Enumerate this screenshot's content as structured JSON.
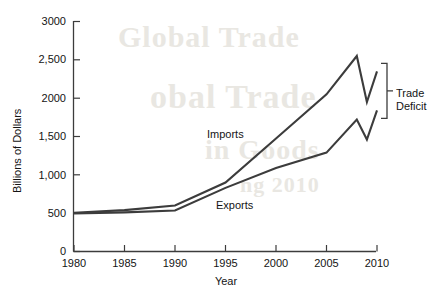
{
  "chart_data": {
    "type": "line",
    "title": "",
    "xlabel": "Year",
    "ylabel": "Billions of Dollars",
    "xlim": [
      1980,
      2010
    ],
    "ylim": [
      0,
      3000
    ],
    "grid": false,
    "legend_position": "inline-labels",
    "x_tick_labels": [
      "1980",
      "1985",
      "1990",
      "1995",
      "2000",
      "2005",
      "2010"
    ],
    "x_ticks": [
      1980,
      1985,
      1990,
      1995,
      2000,
      2005,
      2010
    ],
    "y_tick_labels": [
      "0",
      "500",
      "1,000",
      "1,500",
      "2000",
      "2,500",
      "3000"
    ],
    "y_ticks": [
      0,
      500,
      1000,
      1500,
      2000,
      2500,
      3000
    ],
    "series": [
      {
        "name": "Imports",
        "color": "#3c3c3c",
        "x": [
          1980,
          1985,
          1990,
          1995,
          2000,
          2005,
          2008,
          2009,
          2010
        ],
        "values": [
          505,
          540,
          600,
          900,
          1475,
          2050,
          2550,
          1950,
          2350
        ]
      },
      {
        "name": "Exports",
        "color": "#3c3c3c",
        "x": [
          1980,
          1985,
          1990,
          1995,
          2000,
          2005,
          2008,
          2009,
          2010
        ],
        "values": [
          495,
          510,
          535,
          830,
          1090,
          1290,
          1720,
          1460,
          1840
        ]
      }
    ],
    "annotations": [
      {
        "text": "Imports",
        "kind": "series-label",
        "x": 1994,
        "y": 1625
      },
      {
        "text": "Exports",
        "kind": "series-label",
        "x": 1995,
        "y": 670
      },
      {
        "text": "Trade Deficit",
        "kind": "bracket-label",
        "x": 2011.5,
        "y": 2100
      }
    ],
    "bracket": {
      "label": "Trade Deficit",
      "label_line_1": "Trade",
      "label_line_2": "Deficit",
      "spans_from_series": "Exports",
      "spans_to_series": "Imports",
      "at_x": 2010
    },
    "ghost_text": [
      {
        "text": "Global Trade",
        "x": 118,
        "y": 36,
        "size": 30
      },
      {
        "text": "obal Trade",
        "x": 150,
        "y": 96,
        "size": 34
      },
      {
        "text": "in Goods",
        "x": 205,
        "y": 150,
        "size": 28
      },
      {
        "text": "ng 2010",
        "x": 240,
        "y": 186,
        "size": 22
      }
    ]
  }
}
